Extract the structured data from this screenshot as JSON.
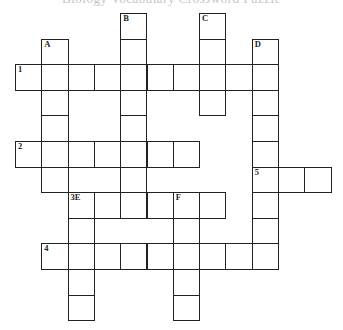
{
  "title": "Biology Vocabulary Crossword Puzzle",
  "grid": {
    "origin_x": 15,
    "origin_y": 13,
    "col_w": 26.3,
    "row_h": 25.6,
    "border_color": "#222222"
  },
  "entries": [
    {
      "label": "1",
      "direction": "across",
      "row": 2,
      "col": 0,
      "length": 10
    },
    {
      "label": "2",
      "direction": "across",
      "row": 5,
      "col": 0,
      "length": 7
    },
    {
      "label": "5",
      "direction": "across",
      "row": 6,
      "col": 9,
      "length": 3
    },
    {
      "label": "3E",
      "direction": "across",
      "row": 7,
      "col": 2,
      "length": 6
    },
    {
      "label": "4",
      "direction": "across",
      "row": 9,
      "col": 1,
      "length": 9
    },
    {
      "label": "A",
      "direction": "down",
      "row": 1,
      "col": 1,
      "length": 6
    },
    {
      "label": "B",
      "direction": "down",
      "row": 0,
      "col": 4,
      "length": 8
    },
    {
      "label": "C",
      "direction": "down",
      "row": 0,
      "col": 7,
      "length": 4
    },
    {
      "label": "D",
      "direction": "down",
      "row": 1,
      "col": 9,
      "length": 9
    },
    {
      "label": "E",
      "direction": "down",
      "row": 7,
      "col": 2,
      "length": 5,
      "label_shared_with": "3E"
    },
    {
      "label": "F",
      "direction": "down",
      "row": 7,
      "col": 6,
      "length": 5
    }
  ]
}
